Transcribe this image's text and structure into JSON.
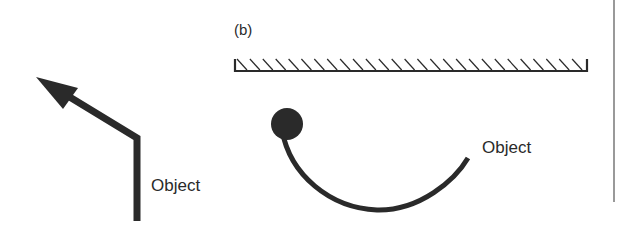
{
  "panel_b": {
    "label": "(b)"
  },
  "left_figure": {
    "object_label": "Object"
  },
  "right_figure": {
    "object_label": "Object"
  },
  "colors": {
    "ink": "#2a2a2a",
    "divider": "#555555",
    "background": "#ffffff"
  },
  "mirror": {
    "hatch_count": 27
  }
}
